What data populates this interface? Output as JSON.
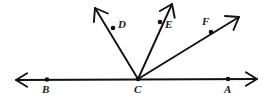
{
  "figure": {
    "type": "geometry-diagram",
    "canvas": {
      "width": 267,
      "height": 105
    },
    "style": {
      "background": "#ffffff",
      "stroke_color": "#111111",
      "stroke_width": 1.9,
      "dot_color": "#111111",
      "dot_radius": 2.3,
      "label_color": "#1a1a1a",
      "label_font_size": 11
    },
    "vertex": {
      "name": "C",
      "x": 138,
      "y": 79
    },
    "line": {
      "name": "line-AB",
      "label": "AB",
      "x1": 16,
      "y1": 80,
      "x2": 257,
      "y2": 79,
      "double_arrow": true
    },
    "points": [
      {
        "name": "B",
        "label": "B",
        "x": 47,
        "y": 79.5,
        "label_x": 43,
        "label_y": 84
      },
      {
        "name": "C",
        "label": "C",
        "x": 138,
        "y": 79,
        "label_x": 134,
        "label_y": 84
      },
      {
        "name": "A",
        "label": "A",
        "x": 228,
        "y": 79,
        "label_x": 224,
        "label_y": 84
      },
      {
        "name": "D",
        "label": "D",
        "x": 113,
        "y": 28,
        "label_x": 118,
        "label_y": 20
      },
      {
        "name": "E",
        "label": "E",
        "x": 160,
        "y": 22,
        "label_x": 165,
        "label_y": 20
      },
      {
        "name": "F",
        "label": "F",
        "x": 211,
        "y": 32,
        "label_x": 203,
        "label_y": 17
      }
    ],
    "rays": [
      {
        "name": "ray-CD",
        "label": "CD",
        "from": "C",
        "through": "D",
        "tip_x": 95,
        "tip_y": 8
      },
      {
        "name": "ray-CE",
        "label": "CE",
        "from": "C",
        "through": "E",
        "tip_x": 172,
        "tip_y": 4
      },
      {
        "name": "ray-CF",
        "label": "CF",
        "from": "C",
        "through": "F",
        "tip_x": 239,
        "tip_y": 17
      }
    ],
    "labels": {
      "A": "A",
      "B": "B",
      "C": "C",
      "D": "D",
      "E": "E",
      "F": "F"
    }
  }
}
